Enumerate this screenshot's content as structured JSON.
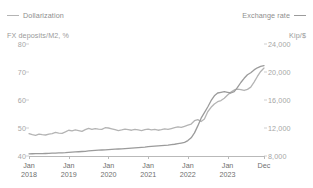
{
  "legend": {
    "left": {
      "label": "Dollarization",
      "color": "#b4b4b4",
      "marker": "line-swatch-icon"
    },
    "right": {
      "label": "Exchange rate",
      "color": "#9b9b9b",
      "marker": "line-swatch-icon"
    }
  },
  "axis_titles": {
    "left": "FX deposits/M2, %",
    "right": "Kip/$"
  },
  "chart_data": {
    "type": "line",
    "title": "",
    "xlabel": "",
    "grid": false,
    "legend_position": "top",
    "x_ticks": [
      {
        "month": "Jan",
        "year": "2018"
      },
      {
        "month": "Jan",
        "year": "2019"
      },
      {
        "month": "Jan",
        "year": "2020"
      },
      {
        "month": "Jan",
        "year": "2021"
      },
      {
        "month": "Jan",
        "year": "2022"
      },
      {
        "month": "Jan",
        "year": "2023"
      },
      {
        "month": "Dec",
        "year": ""
      }
    ],
    "y_left": {
      "label": "FX deposits/M2, %",
      "ticks": [
        "80",
        "70",
        "60",
        "50",
        "40"
      ],
      "tick_values": [
        80,
        70,
        60,
        50,
        40
      ],
      "ylim": [
        40,
        80
      ]
    },
    "y_right": {
      "label": "Kip/$",
      "ticks": [
        "24,000",
        "20,000",
        "16,000",
        "12,000",
        "8,000"
      ],
      "tick_values": [
        24000,
        20000,
        16000,
        12000,
        8000
      ],
      "ylim": [
        8000,
        24000
      ]
    },
    "x": [
      "2018-01",
      "2018-02",
      "2018-03",
      "2018-04",
      "2018-05",
      "2018-06",
      "2018-07",
      "2018-08",
      "2018-09",
      "2018-10",
      "2018-11",
      "2018-12",
      "2019-01",
      "2019-02",
      "2019-03",
      "2019-04",
      "2019-05",
      "2019-06",
      "2019-07",
      "2019-08",
      "2019-09",
      "2019-10",
      "2019-11",
      "2019-12",
      "2020-01",
      "2020-02",
      "2020-03",
      "2020-04",
      "2020-05",
      "2020-06",
      "2020-07",
      "2020-08",
      "2020-09",
      "2020-10",
      "2020-11",
      "2020-12",
      "2021-01",
      "2021-02",
      "2021-03",
      "2021-04",
      "2021-05",
      "2021-06",
      "2021-07",
      "2021-08",
      "2021-09",
      "2021-10",
      "2021-11",
      "2021-12",
      "2022-01",
      "2022-02",
      "2022-03",
      "2022-04",
      "2022-05",
      "2022-06",
      "2022-07",
      "2022-08",
      "2022-09",
      "2022-10",
      "2022-11",
      "2022-12",
      "2023-01",
      "2023-02",
      "2023-03",
      "2023-04",
      "2023-05",
      "2023-06",
      "2023-07",
      "2023-08",
      "2023-09",
      "2023-10",
      "2023-11",
      "2023-12"
    ],
    "series": [
      {
        "name": "Dollarization",
        "axis": "left",
        "unit": "%",
        "color": "#b4b4b4",
        "values": [
          48.0,
          47.6,
          47.4,
          47.8,
          47.6,
          47.5,
          47.8,
          48.0,
          48.4,
          48.2,
          48.1,
          48.6,
          49.2,
          49.0,
          49.3,
          49.1,
          48.8,
          49.4,
          49.9,
          49.5,
          49.8,
          49.6,
          49.5,
          50.1,
          50.0,
          49.7,
          49.4,
          49.1,
          49.3,
          49.6,
          49.4,
          49.2,
          49.5,
          49.3,
          49.1,
          49.4,
          49.6,
          49.3,
          49.5,
          49.2,
          49.4,
          49.7,
          49.5,
          49.8,
          50.1,
          50.4,
          50.2,
          50.6,
          51.0,
          51.4,
          52.6,
          53.0,
          52.3,
          53.2,
          55.8,
          57.4,
          58.6,
          59.4,
          59.8,
          60.6,
          61.8,
          62.8,
          63.6,
          63.9,
          63.7,
          63.4,
          63.8,
          64.6,
          66.4,
          68.4,
          70.2,
          71.4
        ]
      },
      {
        "name": "Exchange rate",
        "axis": "right",
        "unit": "Kip/$",
        "color": "#9b9b9b",
        "values": [
          8310,
          8320,
          8330,
          8340,
          8350,
          8360,
          8380,
          8400,
          8420,
          8440,
          8460,
          8480,
          8520,
          8550,
          8580,
          8610,
          8640,
          8670,
          8720,
          8760,
          8800,
          8840,
          8860,
          8880,
          8920,
          8950,
          8980,
          9000,
          9020,
          9050,
          9080,
          9120,
          9160,
          9200,
          9240,
          9280,
          9340,
          9380,
          9420,
          9450,
          9480,
          9520,
          9560,
          9620,
          9680,
          9760,
          9850,
          9950,
          10200,
          10600,
          11300,
          12300,
          13400,
          14200,
          15000,
          15900,
          16600,
          17000,
          17100,
          17200,
          17100,
          17000,
          17200,
          17800,
          18500,
          19100,
          19600,
          19900,
          20300,
          20600,
          20800,
          20900
        ]
      }
    ]
  }
}
